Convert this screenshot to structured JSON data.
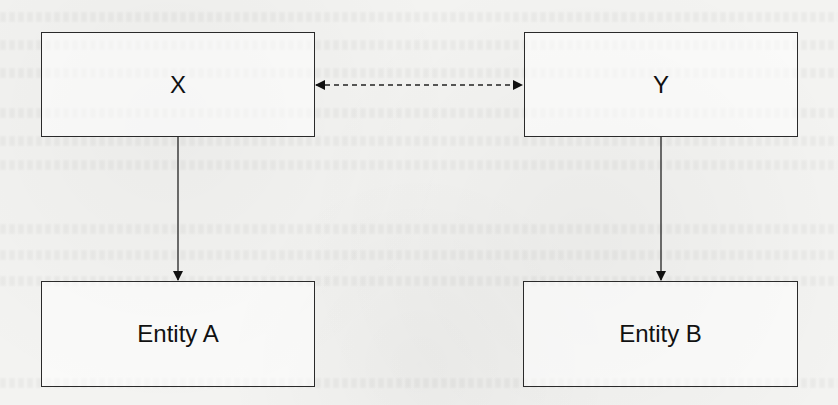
{
  "diagram": {
    "nodes": [
      {
        "id": "X",
        "label": "X"
      },
      {
        "id": "Y",
        "label": "Y"
      },
      {
        "id": "A",
        "label": "Entity A"
      },
      {
        "id": "B",
        "label": "Entity B"
      }
    ],
    "edges": [
      {
        "from": "X",
        "to": "Y",
        "style": "dashed",
        "direction": "bidirectional"
      },
      {
        "from": "X",
        "to": "A",
        "style": "solid",
        "direction": "forward"
      },
      {
        "from": "Y",
        "to": "B",
        "style": "solid",
        "direction": "forward"
      }
    ],
    "colors": {
      "stroke": "#2a2a2a",
      "background": "#f3f3f1",
      "text": "#111111"
    }
  }
}
